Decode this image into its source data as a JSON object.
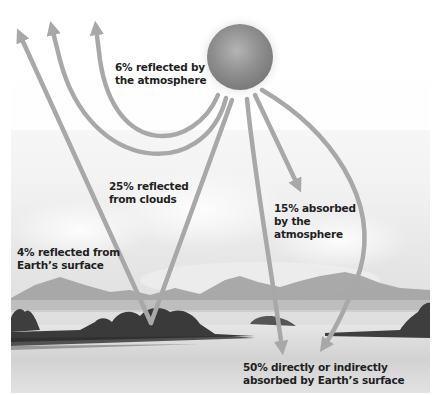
{
  "diagram": {
    "colors": {
      "arrow": "#a8a8a8",
      "sun": "#8e8e8e",
      "mountains": "#9a9a9a",
      "land_dark": "#3c3c3c",
      "water": "#dcdcdc",
      "sky": "#f4f4f4",
      "text": "#1f1f1f"
    },
    "labels": {
      "reflected_atmosphere": {
        "line1": "6% reflected by",
        "line2": "the atmosphere"
      },
      "reflected_clouds": {
        "line1": "25% reflected",
        "line2": "from clouds"
      },
      "absorbed_atmosphere": {
        "line1": "15% absorbed",
        "line2": "by the",
        "line3": "atmosphere"
      },
      "reflected_surface": {
        "line1": "4% reflected from",
        "line2": "Earth’s surface"
      },
      "absorbed_surface": {
        "line1": "50% directly or indirectly",
        "line2": "absorbed by Earth’s surface"
      }
    },
    "icons": {
      "sun": "sun-icon"
    }
  }
}
